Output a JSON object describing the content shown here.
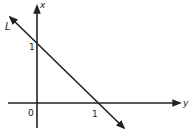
{
  "diagram": {
    "type": "coordinate-graph",
    "axes": {
      "vertical_label": "x",
      "horizontal_label": "y",
      "origin_label": "0"
    },
    "line": {
      "label": "L",
      "intercept_vertical_label": "1",
      "intercept_horizontal_label": "1"
    },
    "colors": {
      "ink": "#222222",
      "background": "#ffffff"
    }
  }
}
